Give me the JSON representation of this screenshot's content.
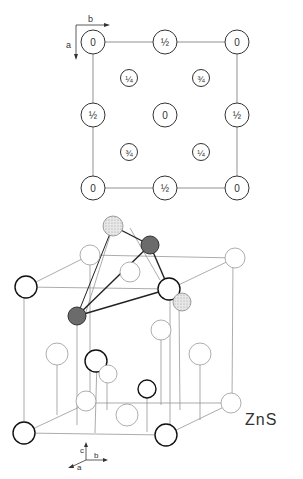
{
  "projection": {
    "axis_labels": {
      "b": "b",
      "a": "a"
    },
    "atoms": [
      {
        "label": "0",
        "kind": "large",
        "pos": "corner-top-left"
      },
      {
        "label": "½",
        "kind": "large",
        "pos": "edge-top"
      },
      {
        "label": "0",
        "kind": "large",
        "pos": "corner-top-right"
      },
      {
        "label": "¼",
        "kind": "small",
        "pos": "quarter-tl"
      },
      {
        "label": "¾",
        "kind": "small",
        "pos": "quarter-tr"
      },
      {
        "label": "½",
        "kind": "large",
        "pos": "edge-left"
      },
      {
        "label": "0",
        "kind": "large",
        "pos": "center"
      },
      {
        "label": "½",
        "kind": "large",
        "pos": "edge-right"
      },
      {
        "label": "¾",
        "kind": "small",
        "pos": "quarter-bl"
      },
      {
        "label": "¼",
        "kind": "small",
        "pos": "quarter-br"
      },
      {
        "label": "0",
        "kind": "large",
        "pos": "corner-bottom-left"
      },
      {
        "label": "½",
        "kind": "large",
        "pos": "edge-bottom"
      },
      {
        "label": "0",
        "kind": "large",
        "pos": "corner-bottom-right"
      }
    ]
  },
  "structure": {
    "compound_label": "ZnS",
    "axis_labels": {
      "c": "c",
      "b": "b",
      "a": "a"
    }
  },
  "colors": {
    "line": "#555555",
    "atom_dark": "#6b6b6b",
    "atom_stipple": "#cfcfcf"
  }
}
